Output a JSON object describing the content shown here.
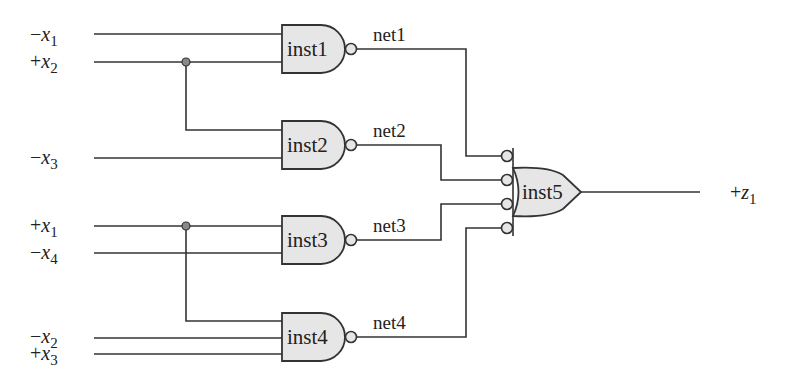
{
  "diagram": {
    "type": "logic-circuit",
    "inputs": [
      {
        "id": "in_x1_neg",
        "polarity": "−",
        "var": "x",
        "sub": "1"
      },
      {
        "id": "in_x2_pos",
        "polarity": "+",
        "var": "x",
        "sub": "2"
      },
      {
        "id": "in_x3_neg",
        "polarity": "−",
        "var": "x",
        "sub": "3"
      },
      {
        "id": "in_x1_pos",
        "polarity": "+",
        "var": "x",
        "sub": "1"
      },
      {
        "id": "in_x4_neg",
        "polarity": "−",
        "var": "x",
        "sub": "4"
      },
      {
        "id": "in_x2_neg",
        "polarity": "−",
        "var": "x",
        "sub": "2"
      },
      {
        "id": "in_x3_pos",
        "polarity": "+",
        "var": "x",
        "sub": "3"
      }
    ],
    "gates": [
      {
        "id": "inst1",
        "label": "inst1",
        "kind": "NAND",
        "inputs": [
          "-x1",
          "+x2"
        ],
        "output": "net1"
      },
      {
        "id": "inst2",
        "label": "inst2",
        "kind": "NAND",
        "inputs": [
          "+x2",
          "-x3"
        ],
        "output": "net2"
      },
      {
        "id": "inst3",
        "label": "inst3",
        "kind": "NAND",
        "inputs": [
          "+x1",
          "-x4"
        ],
        "output": "net3"
      },
      {
        "id": "inst4",
        "label": "inst4",
        "kind": "NAND",
        "inputs": [
          "+x1",
          "-x2",
          "+x3"
        ],
        "output": "net4"
      },
      {
        "id": "inst5",
        "label": "inst5",
        "kind": "OR (inverted inputs)",
        "inputs": [
          "net1",
          "net2",
          "net3",
          "net4"
        ],
        "output": "+z1"
      }
    ],
    "nets": [
      "net1",
      "net2",
      "net3",
      "net4"
    ],
    "output": {
      "polarity": "+",
      "var": "z",
      "sub": "1"
    },
    "colors": {
      "gate_fill": "#e6e6e6",
      "stroke": "#333333",
      "junction": "#888888"
    }
  }
}
